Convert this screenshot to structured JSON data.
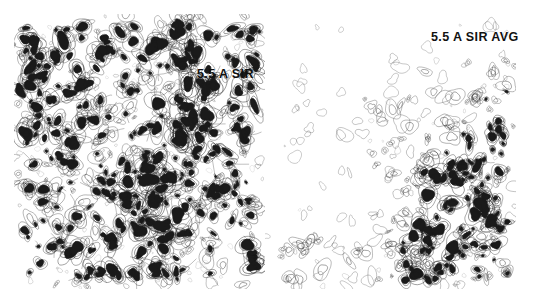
{
  "figure": {
    "width": 535,
    "height": 305,
    "background_color": "#ffffff",
    "ink_color": "#1a1a1a"
  },
  "panels": [
    {
      "id": "left",
      "label": "5.5 A SIR",
      "label_x": 197,
      "label_y": 67,
      "resolution": "5.5 A",
      "method": "SIR",
      "averaged": false,
      "x": 14,
      "y": 14,
      "width": 251,
      "height": 275,
      "density": "high",
      "blob_count": 520,
      "noise_count": 260
    },
    {
      "id": "right",
      "label": "5.5 A SIR AVG",
      "label_x": 431,
      "label_y": 30,
      "resolution": "5.5 A",
      "method": "SIR",
      "averaged": true,
      "x": 265,
      "y": 14,
      "width": 251,
      "height": 275,
      "density": "low",
      "blob_count": 300,
      "noise_count": 170
    }
  ],
  "chart_data": {
    "type": "heatmap",
    "title": "",
    "subtitle": "",
    "xlabel": "",
    "ylabel": "",
    "grid": false,
    "legend_position": "none",
    "annotations": [
      {
        "text": "5.5 A SIR",
        "x": 197,
        "y": 67,
        "panel": "left"
      },
      {
        "text": "5.5 A SIR AVG",
        "x": 431,
        "y": 30,
        "panel": "right"
      }
    ],
    "series": [
      {
        "name": "5.5 A SIR",
        "panel": "left",
        "contour_levels": [
          1,
          2,
          3,
          4
        ],
        "mean_feature_density": 0.92,
        "note": "Uniformly dense contour field across entire panel"
      },
      {
        "name": "5.5 A SIR AVG",
        "panel": "right",
        "contour_levels": [
          1,
          2,
          3,
          4
        ],
        "mean_feature_density": 0.38,
        "note": "Sparse in upper-left, density increases toward right and lower-right corner"
      }
    ]
  }
}
